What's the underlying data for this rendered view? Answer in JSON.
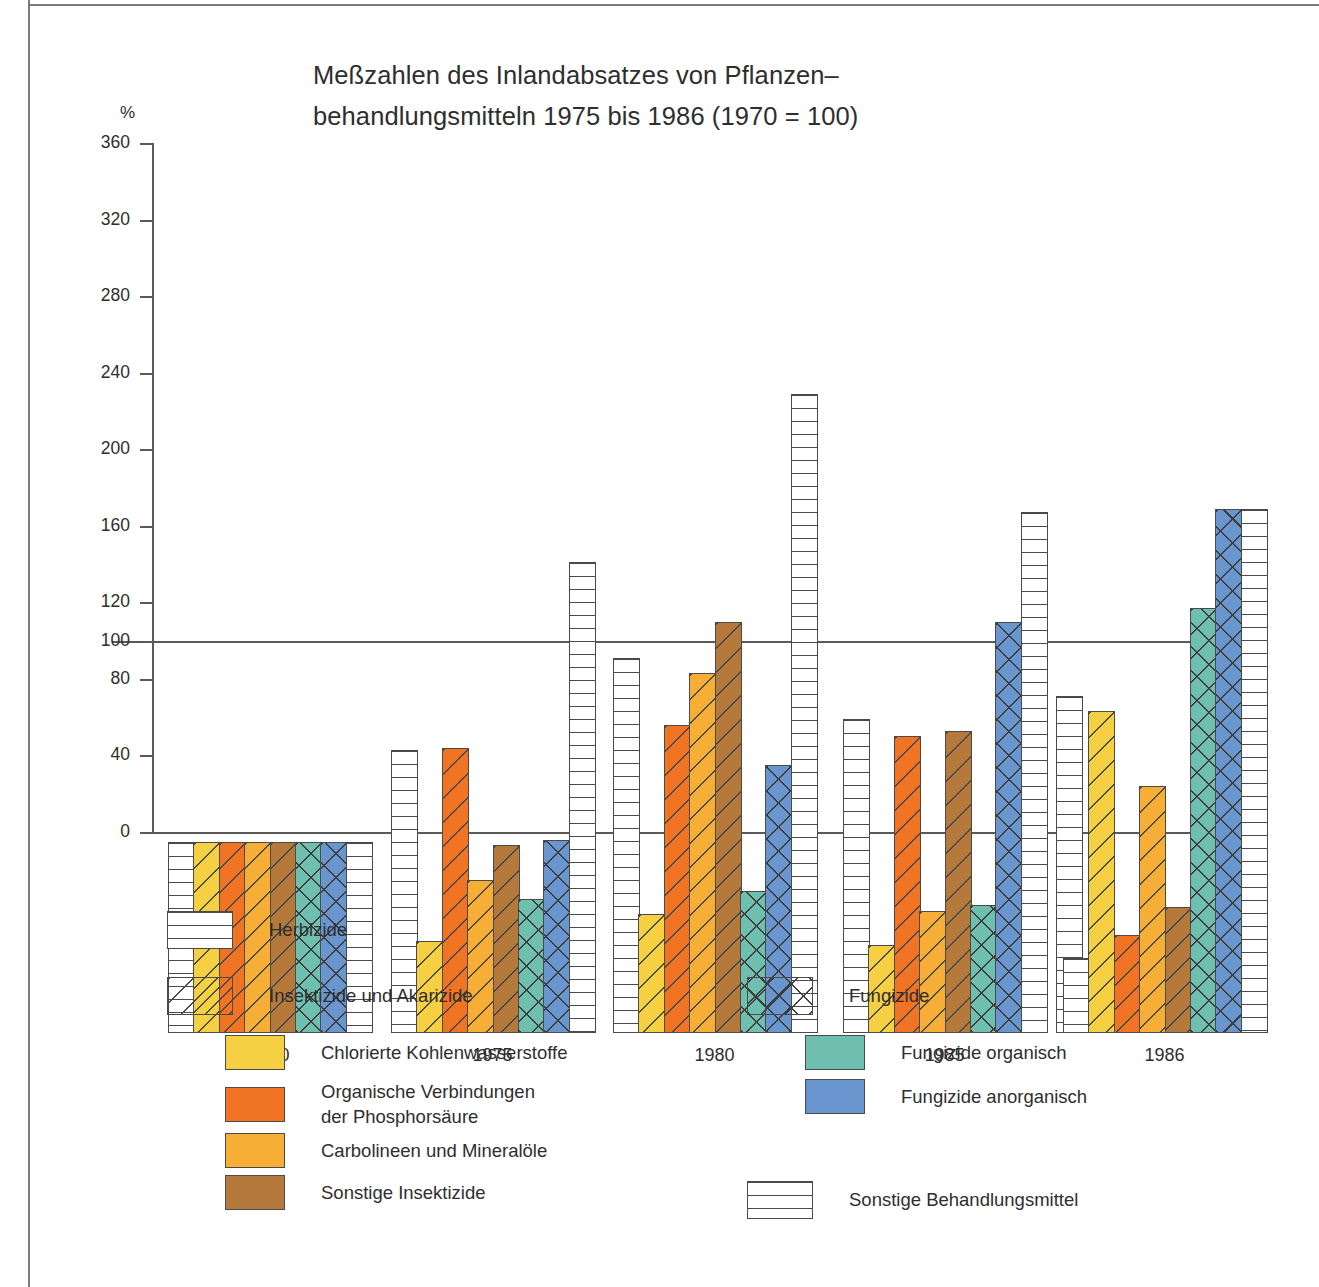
{
  "chart_data": {
    "type": "bar",
    "title_line1": "Meßzahlen des Inlandabsatzes von Pflanzen–",
    "title_line2": "behandlungsmitteln 1975 bis 1986 (1970 = 100)",
    "ylabel": "%",
    "xlabel": "",
    "ylim": [
      0,
      360
    ],
    "yticks": [
      "0",
      "40",
      "80",
      "100",
      "120",
      "160",
      "200",
      "240",
      "280",
      "320",
      "360"
    ],
    "reference_line": 100,
    "grid": false,
    "legend_position": "below",
    "categories": [
      "1970",
      "1975",
      "1980",
      "1985",
      "1986"
    ],
    "series": [
      {
        "name": "Herbizide",
        "pattern": "horizontal-lines",
        "color": "#ffffff",
        "values": [
          100,
          148,
          196,
          164,
          39
        ]
      },
      {
        "name": "Chlorierte Kohlenwasserstoffe",
        "pattern": "diagonal-lines",
        "color": "#F5D043",
        "values": [
          100,
          48,
          62,
          46,
          168
        ]
      },
      {
        "name": "Organische Verbindungen der Phosphorsäure",
        "pattern": "diagonal-lines",
        "color": "#F07424",
        "values": [
          100,
          149,
          161,
          155,
          51
        ]
      },
      {
        "name": "Carbolineen und Mineralöle",
        "pattern": "diagonal-lines",
        "color": "#F6AE36",
        "values": [
          100,
          80,
          188,
          64,
          129
        ]
      },
      {
        "name": "Sonstige Insektizide",
        "pattern": "diagonal-lines",
        "color": "#B5793C",
        "values": [
          100,
          98,
          215,
          158,
          66
        ]
      },
      {
        "name": "Fungizide organisch",
        "pattern": "crosshatch",
        "color": "#6EBFB0",
        "values": [
          100,
          70,
          74,
          67,
          222
        ]
      },
      {
        "name": "Fungizide anorganisch",
        "pattern": "crosshatch",
        "color": "#6A96D0",
        "values": [
          100,
          101,
          140,
          215,
          274
        ]
      },
      {
        "name": "Sonstige Behandlungsmittel",
        "pattern": "horizontal-lines",
        "color": "#ffffff",
        "values": [
          100,
          246,
          334,
          272,
          176
        ]
      }
    ]
  },
  "groups": [
    {
      "year": "1970",
      "bars": [
        {
          "series": "Herbizide",
          "pattern": "horiz",
          "color": "#ffffff",
          "value": 100
        },
        {
          "series": "Chlorierte Kohlenwasserstoffe",
          "pattern": "diag",
          "color": "#F5D043",
          "value": 100
        },
        {
          "series": "Organische Verbindungen der Phosphorsäure",
          "pattern": "diag",
          "color": "#F07424",
          "value": 100
        },
        {
          "series": "Carbolineen und Mineralöle",
          "pattern": "diag",
          "color": "#F6AE36",
          "value": 100
        },
        {
          "series": "Sonstige Insektizide",
          "pattern": "diag",
          "color": "#B5793C",
          "value": 100
        },
        {
          "series": "Fungizide organisch",
          "pattern": "cross",
          "color": "#6EBFB0",
          "value": 100
        },
        {
          "series": "Fungizide anorganisch",
          "pattern": "cross",
          "color": "#6A96D0",
          "value": 100
        },
        {
          "series": "Sonstige Behandlungsmittel",
          "pattern": "horiz",
          "color": "#ffffff",
          "value": 100
        }
      ]
    },
    {
      "year": "1975",
      "bars": [
        {
          "series": "Herbizide",
          "pattern": "horiz",
          "color": "#ffffff",
          "value": 148
        },
        {
          "series": "Chlorierte Kohlenwasserstoffe",
          "pattern": "diag",
          "color": "#F5D043",
          "value": 48
        },
        {
          "series": "Organische Verbindungen der Phosphorsäure",
          "pattern": "diag",
          "color": "#F07424",
          "value": 149
        },
        {
          "series": "Carbolineen und Mineralöle",
          "pattern": "diag",
          "color": "#F6AE36",
          "value": 80
        },
        {
          "series": "Sonstige Insektizide",
          "pattern": "diag",
          "color": "#B5793C",
          "value": 98
        },
        {
          "series": "Fungizide organisch",
          "pattern": "cross",
          "color": "#6EBFB0",
          "value": 70
        },
        {
          "series": "Fungizide anorganisch",
          "pattern": "cross",
          "color": "#6A96D0",
          "value": 101
        },
        {
          "series": "Sonstige Behandlungsmittel",
          "pattern": "horiz",
          "color": "#ffffff",
          "value": 246
        }
      ]
    },
    {
      "year": "1980",
      "bars": [
        {
          "series": "Herbizide",
          "pattern": "horiz",
          "color": "#ffffff",
          "value": 196
        },
        {
          "series": "Chlorierte Kohlenwasserstoffe",
          "pattern": "diag",
          "color": "#F5D043",
          "value": 62
        },
        {
          "series": "Organische Verbindungen der Phosphorsäure",
          "pattern": "diag",
          "color": "#F07424",
          "value": 161
        },
        {
          "series": "Carbolineen und Mineralöle",
          "pattern": "diag",
          "color": "#F6AE36",
          "value": 188
        },
        {
          "series": "Sonstige Insektizide",
          "pattern": "diag",
          "color": "#B5793C",
          "value": 215
        },
        {
          "series": "Fungizide organisch",
          "pattern": "cross",
          "color": "#6EBFB0",
          "value": 74
        },
        {
          "series": "Fungizide anorganisch",
          "pattern": "cross",
          "color": "#6A96D0",
          "value": 140
        },
        {
          "series": "Sonstige Behandlungsmittel",
          "pattern": "horiz",
          "color": "#ffffff",
          "value": 334
        }
      ]
    },
    {
      "year": "1985",
      "bars": [
        {
          "series": "Herbizide",
          "pattern": "horiz",
          "color": "#ffffff",
          "value": 164
        },
        {
          "series": "Chlorierte Kohlenwasserstoffe",
          "pattern": "diag",
          "color": "#F5D043",
          "value": 46
        },
        {
          "series": "Organische Verbindungen der Phosphorsäure",
          "pattern": "diag",
          "color": "#F07424",
          "value": 155
        },
        {
          "series": "Carbolineen und Mineralöle",
          "pattern": "diag",
          "color": "#F6AE36",
          "value": 64
        },
        {
          "series": "Sonstige Insektizide",
          "pattern": "diag",
          "color": "#B5793C",
          "value": 158
        },
        {
          "series": "Fungizide organisch",
          "pattern": "cross",
          "color": "#6EBFB0",
          "value": 67
        },
        {
          "series": "Fungizide anorganisch",
          "pattern": "cross",
          "color": "#6A96D0",
          "value": 215
        },
        {
          "series": "Sonstige Behandlungsmittel",
          "pattern": "horiz",
          "color": "#ffffff",
          "value": 272
        },
        {
          "series": "Sonstige Behandlungsmittel",
          "pattern": "horiz",
          "color": "#ffffff",
          "value": 176,
          "detached": true
        }
      ]
    },
    {
      "year": "1986",
      "bars": [
        {
          "series": "Herbizide",
          "pattern": "horiz",
          "color": "#ffffff",
          "value": 39
        },
        {
          "series": "Chlorierte Kohlenwasserstoffe",
          "pattern": "diag",
          "color": "#F5D043",
          "value": 168
        },
        {
          "series": "Organische Verbindungen der Phosphorsäure",
          "pattern": "diag",
          "color": "#F07424",
          "value": 51
        },
        {
          "series": "Carbolineen und Mineralöle",
          "pattern": "diag",
          "color": "#F6AE36",
          "value": 129
        },
        {
          "series": "Sonstige Insektizide",
          "pattern": "diag",
          "color": "#B5793C",
          "value": 66
        },
        {
          "series": "Fungizide organisch",
          "pattern": "cross",
          "color": "#6EBFB0",
          "value": 222
        },
        {
          "series": "Fungizide anorganisch",
          "pattern": "cross",
          "color": "#6A96D0",
          "value": 274
        },
        {
          "series": "Sonstige Behandlungsmittel",
          "pattern": "horiz",
          "color": "#ffffff",
          "value": 274
        }
      ]
    }
  ],
  "legend": {
    "left": [
      {
        "label": "Herbizide",
        "pattern": "horiz",
        "color": "#ffffff",
        "indent": 0
      },
      {
        "label": "Insektizide und Akarizide",
        "pattern": "diag",
        "color": "#ffffff",
        "indent": 0
      },
      {
        "label": "Chlorierte Kohlenwasserstoffe",
        "pattern": "solid",
        "color": "#F5D043",
        "indent": 1
      },
      {
        "label": "Organische Verbindungen\nder Phosphorsäure",
        "pattern": "solid",
        "color": "#F07424",
        "indent": 1
      },
      {
        "label": "Carbolineen und Mineralöle",
        "pattern": "solid",
        "color": "#F6AE36",
        "indent": 1
      },
      {
        "label": "Sonstige Insektizide",
        "pattern": "solid",
        "color": "#B5793C",
        "indent": 1
      }
    ],
    "right": [
      {
        "label": "Fungizide",
        "pattern": "cross",
        "color": "#ffffff",
        "indent": 0
      },
      {
        "label": "Fungizide organisch",
        "pattern": "solid",
        "color": "#6EBFB0",
        "indent": 1
      },
      {
        "label": "Fungizide anorganisch",
        "pattern": "solid",
        "color": "#6A96D0",
        "indent": 1
      },
      {
        "label": "Sonstige Behandlungsmittel",
        "pattern": "horiz",
        "color": "#ffffff",
        "indent": 0
      }
    ]
  }
}
